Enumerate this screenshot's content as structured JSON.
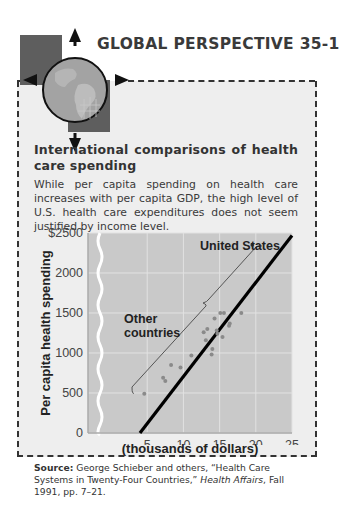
{
  "header": {
    "label": "GLOBAL PERSPECTIVE 35-1",
    "icon": "globe-compass-icon"
  },
  "figure": {
    "title": "International comparisons of health care spending",
    "description": "While per capita spending on health care increases with per capita GDP, the high level of U.S. health care expenditures does not seem justified by income level.",
    "source_label": "Source:",
    "source_text_1": " George Schieber and others, “Health Care Systems in Twenty-Four Countries,” ",
    "source_journal": "Health Affairs",
    "source_text_2": ", Fall 1991, pp. 7–21."
  },
  "colors": {
    "panel_bg": "#eeeeee",
    "plot_bg": "#c9c9c9",
    "grid": "#e4e4e4",
    "points": "#8a8a8a",
    "fit_line": "#000000",
    "globe": "#9a9a9a",
    "square": "#5a5a5a"
  },
  "chart_data": {
    "type": "scatter",
    "title": "International comparisons of health care spending",
    "xlabel": "Per capita GDP (thousands of dollars)",
    "xlabel_line1": "Per capita GDP",
    "xlabel_line2": "(thousands of dollars)",
    "ylabel": "Per capita health spending",
    "xlim": [
      0,
      25
    ],
    "ylim": [
      0,
      2500
    ],
    "x_ticks": [
      5,
      10,
      15,
      20,
      25
    ],
    "x_tick_labels": [
      "5",
      "10",
      "15",
      "20",
      "25"
    ],
    "y_ticks": [
      0,
      500,
      1000,
      1500,
      2000,
      2500
    ],
    "y_tick_labels": [
      "0",
      "500",
      "1000",
      "1500",
      "2000",
      "$2500"
    ],
    "grid": true,
    "axis_break": "x-axis break between 0 and ~3",
    "annotations": [
      {
        "text": "United States",
        "x": 19.5,
        "y": 2350
      },
      {
        "text": "Other countries",
        "bracket": true
      }
    ],
    "series": [
      {
        "name": "United States",
        "points": [
          {
            "x": 19.5,
            "y": 2350
          }
        ]
      },
      {
        "name": "Other countries",
        "points": [
          {
            "x": 4.6,
            "y": 490
          },
          {
            "x": 7.2,
            "y": 690
          },
          {
            "x": 7.5,
            "y": 650
          },
          {
            "x": 8.3,
            "y": 850
          },
          {
            "x": 9.6,
            "y": 820
          },
          {
            "x": 11.1,
            "y": 970
          },
          {
            "x": 12.8,
            "y": 1260
          },
          {
            "x": 13.1,
            "y": 1160
          },
          {
            "x": 13.3,
            "y": 1300
          },
          {
            "x": 13.9,
            "y": 980
          },
          {
            "x": 14.0,
            "y": 1050
          },
          {
            "x": 14.3,
            "y": 1430
          },
          {
            "x": 14.6,
            "y": 1280
          },
          {
            "x": 14.7,
            "y": 1240
          },
          {
            "x": 15.1,
            "y": 1500
          },
          {
            "x": 15.4,
            "y": 1200
          },
          {
            "x": 15.6,
            "y": 1500
          },
          {
            "x": 16.3,
            "y": 1340
          },
          {
            "x": 16.4,
            "y": 1370
          },
          {
            "x": 18.0,
            "y": 1500
          }
        ]
      },
      {
        "name": "Fitted line",
        "type": "line",
        "points": [
          {
            "x": 4.0,
            "y": 0
          },
          {
            "x": 25.0,
            "y": 2470
          }
        ]
      }
    ]
  }
}
